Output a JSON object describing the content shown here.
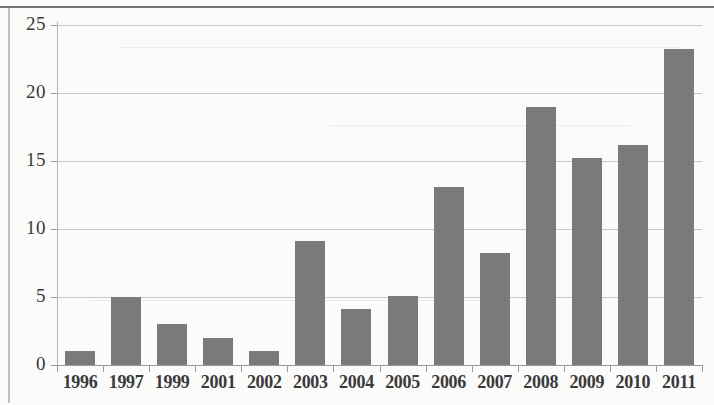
{
  "chart_data": {
    "type": "bar",
    "title": "",
    "subtitle": "",
    "xlabel": "",
    "ylabel": "",
    "categories": [
      "1996",
      "1997",
      "1999",
      "2001",
      "2002",
      "2003",
      "2004",
      "2005",
      "2006",
      "2007",
      "2008",
      "2009",
      "2010",
      "2011"
    ],
    "values": [
      1,
      5,
      3,
      2,
      1,
      9.1,
      4.1,
      5.1,
      13.1,
      8.2,
      19,
      15.2,
      16.2,
      23.2
    ],
    "series": [
      {
        "name": "",
        "values": [
          1,
          5,
          3,
          2,
          1,
          9.1,
          4.1,
          5.1,
          13.1,
          8.2,
          19,
          15.2,
          16.2,
          23.2
        ]
      }
    ],
    "ylim": [
      0,
      25
    ],
    "yticks": [
      0,
      5,
      10,
      15,
      20,
      25
    ],
    "ytick_labels": [
      "0",
      "5",
      "10",
      "15",
      "20",
      "25"
    ],
    "grid": true,
    "grid_axis": "y",
    "legend": false,
    "legend_position": "none",
    "bar_color": "#7a7a7a",
    "gridline_color": "#c9c9c6",
    "axis_color": "#9a9a97",
    "background_color": "#fbfbfa",
    "text_color": "#3a3a3a"
  }
}
